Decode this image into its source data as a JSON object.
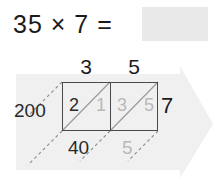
{
  "equation": {
    "expression": "35 × 7 =",
    "multiplicand": "35",
    "operator": "×",
    "multiplier": "7",
    "equals": "=",
    "answer_value": "",
    "answer_placeholder": ""
  },
  "lattice": {
    "column_heads": [
      "3",
      "5"
    ],
    "row_multiplier": "7",
    "cells": [
      {
        "tens": "2",
        "ones": "1",
        "tens_state": "dark",
        "ones_state": "faded"
      },
      {
        "tens": "3",
        "ones": "5",
        "tens_state": "faded",
        "ones_state": "faded"
      }
    ],
    "diagonal_sums": {
      "left": "200",
      "bottom": [
        "40",
        "5"
      ]
    }
  },
  "colors": {
    "ink_dark": "#2a2a2a",
    "ink_faded": "#b9b9b9",
    "grid_line": "#4a4a4a",
    "banner_fill": "#f0f0f0",
    "answer_box_fill": "#e9e9e9"
  }
}
